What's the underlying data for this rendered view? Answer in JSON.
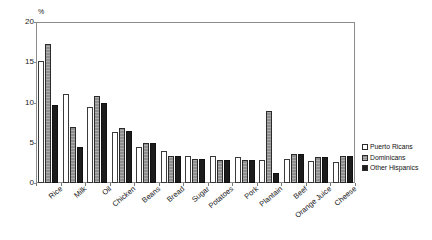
{
  "chart_data": {
    "type": "bar",
    "title": "",
    "xlabel": "",
    "ylabel": "%",
    "ylim": [
      0,
      20
    ],
    "yticks": [
      0,
      5,
      10,
      15,
      20
    ],
    "grid": false,
    "legend_position": "right",
    "categories": [
      "Rice",
      "Milk",
      "Oil",
      "Chicken",
      "Beans",
      "Bread",
      "Sugar",
      "Potatoes",
      "Pork",
      "Plantain",
      "Beef",
      "Orange Juice",
      "Cheese"
    ],
    "series": [
      {
        "name": "Puerto Ricans",
        "values": [
          15.2,
          11.1,
          9.5,
          6.3,
          4.5,
          4.0,
          3.3,
          3.3,
          3.2,
          2.8,
          3.0,
          2.7,
          2.6
        ]
      },
      {
        "name": "Dominicans",
        "values": [
          17.3,
          7.0,
          10.8,
          6.8,
          5.0,
          3.3,
          3.0,
          2.8,
          2.9,
          9.0,
          3.6,
          3.2,
          3.3
        ]
      },
      {
        "name": "Other Hispanics",
        "values": [
          9.7,
          4.5,
          10.0,
          6.5,
          5.0,
          3.3,
          3.0,
          2.8,
          2.9,
          1.3,
          3.6,
          3.2,
          3.3
        ]
      }
    ]
  },
  "axis": {
    "unit_label": "%",
    "ytick_labels": [
      "0",
      "5",
      "10",
      "15",
      "20"
    ]
  },
  "legend": {
    "items": [
      {
        "label": "Puerto Ricans",
        "swatch": "legend-swatch-white",
        "color": "#ffffff"
      },
      {
        "label": "Dominicans",
        "swatch": "legend-swatch-gray",
        "color": "#8f8f8f"
      },
      {
        "label": "Other Hispanics",
        "swatch": "legend-swatch-black",
        "color": "#1c1c1c"
      }
    ]
  }
}
